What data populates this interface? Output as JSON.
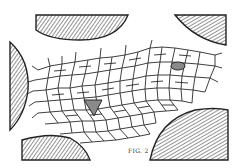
{
  "figure": {
    "label": "FIG. 2",
    "colors": {
      "line": "#2a2a2a",
      "hatch": "#3a3a3a",
      "shaded_cell": "#8a8a8a",
      "background": "#ffffff"
    },
    "hatched_regions": [
      {
        "id": "top-left",
        "position": "top"
      },
      {
        "id": "top-right",
        "position": "top-right"
      },
      {
        "id": "left",
        "position": "left"
      },
      {
        "id": "bottom-left",
        "position": "bottom-left"
      },
      {
        "id": "bottom-right",
        "position": "bottom-right"
      }
    ],
    "shaded_cells": [
      {
        "id": "center-left",
        "shape": "triangle"
      },
      {
        "id": "upper-right",
        "shape": "oval"
      }
    ]
  }
}
